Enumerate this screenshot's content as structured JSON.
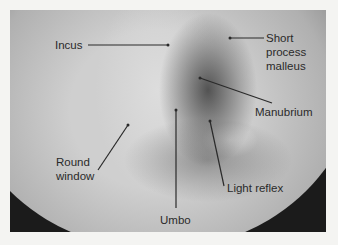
{
  "figure": {
    "labels": [
      {
        "id": "incus",
        "text": "Incus"
      },
      {
        "id": "short-process-malleus",
        "lines": [
          "Short",
          "process",
          "malleus"
        ]
      },
      {
        "id": "manubrium",
        "text": "Manubrium"
      },
      {
        "id": "round-window",
        "lines": [
          "Round",
          "window"
        ]
      },
      {
        "id": "umbo",
        "text": "Umbo"
      },
      {
        "id": "light-reflex",
        "text": "Light reflex"
      }
    ]
  },
  "colors": {
    "background": "#f4f4f2",
    "frame_dark": "#1b1b1b",
    "membrane": "#cfcfcf",
    "label_text": "#2a2a2a"
  }
}
